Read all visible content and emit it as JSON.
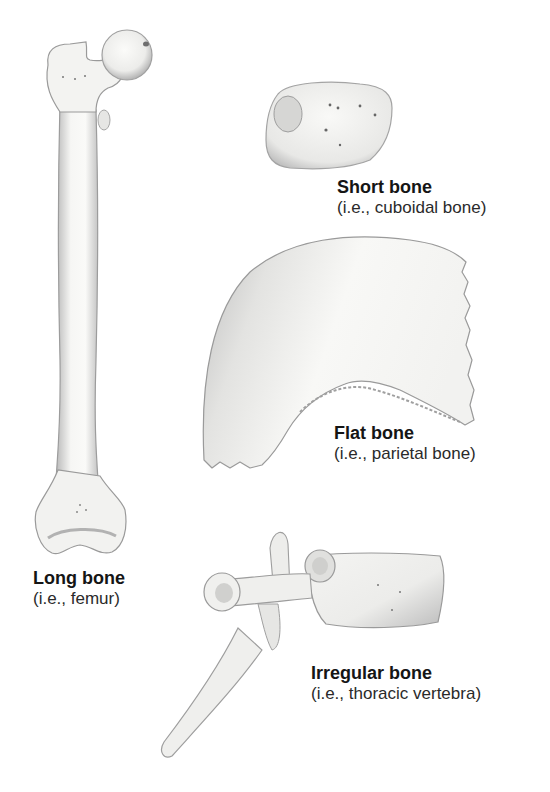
{
  "figure": {
    "background": "#ffffff",
    "bone_fill": "#f4f3f1",
    "shade_color": "#9a9a9a",
    "outline_color": "#6e6e6e"
  },
  "bones": {
    "long": {
      "title": "Long bone",
      "example": "(i.e., femur)"
    },
    "short": {
      "title": "Short bone",
      "example": "(i.e., cuboidal bone)"
    },
    "flat": {
      "title": "Flat bone",
      "example": "(i.e., parietal bone)"
    },
    "irregular": {
      "title": "Irregular bone",
      "example": "(i.e., thoracic vertebra)"
    }
  }
}
